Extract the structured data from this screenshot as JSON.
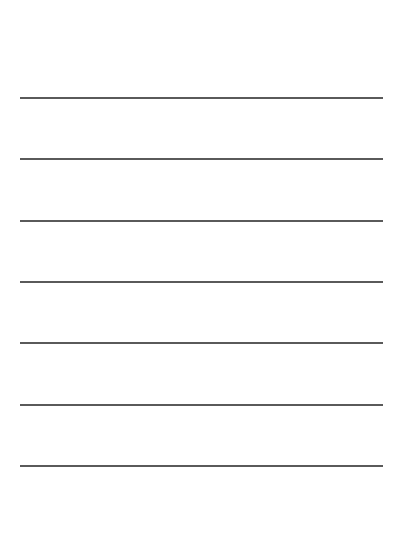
{
  "page": {
    "background": "#ffffff",
    "line_color": "#5a5a5a",
    "line_left": 20,
    "line_width": 363,
    "line_thickness": 2
  },
  "lines": [
    {
      "y": 97
    },
    {
      "y": 158
    },
    {
      "y": 220
    },
    {
      "y": 281
    },
    {
      "y": 342
    },
    {
      "y": 404
    },
    {
      "y": 465
    }
  ]
}
